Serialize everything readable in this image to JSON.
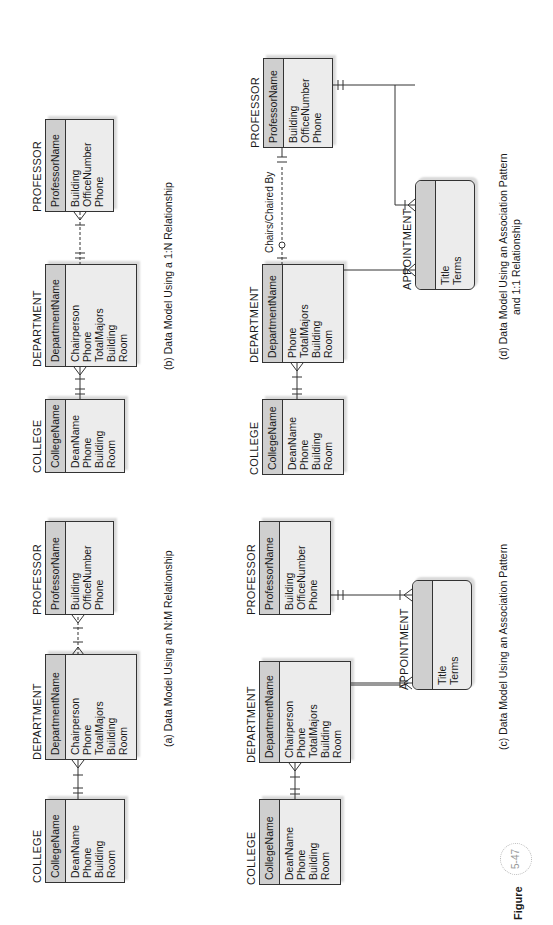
{
  "figure": {
    "label": "Figure",
    "number": "5-47"
  },
  "panels": {
    "a": {
      "caption": "(a) Data Model Using an N:M Relationship",
      "college": {
        "title": "COLLEGE",
        "key": "CollegeName",
        "attrs": [
          "DeanName",
          "Phone",
          "Building",
          "Room"
        ]
      },
      "department": {
        "title": "DEPARTMENT",
        "key": "DepartmentName",
        "attrs": [
          "Chairperson",
          "Phone",
          "TotalMajors",
          "Building",
          "Room"
        ]
      },
      "professor": {
        "title": "PROFESSOR",
        "key": "ProfessorName",
        "attrs": [
          "Building",
          "OfficeNumber",
          "Phone"
        ]
      }
    },
    "b": {
      "caption": "(b) Data Model Using a 1:N Relationship",
      "college": {
        "title": "COLLEGE",
        "key": "CollegeName",
        "attrs": [
          "DeanName",
          "Phone",
          "Building",
          "Room"
        ]
      },
      "department": {
        "title": "DEPARTMENT",
        "key": "DepartmentName",
        "attrs": [
          "Chairperson",
          "Phone",
          "TotalMajors",
          "Building",
          "Room"
        ]
      },
      "professor": {
        "title": "PROFESSOR",
        "key": "ProfessorName",
        "attrs": [
          "Building",
          "OfficeNumber",
          "Phone"
        ]
      }
    },
    "c": {
      "caption": "(c) Data Model Using an Association Pattern",
      "college": {
        "title": "COLLEGE",
        "key": "CollegeName",
        "attrs": [
          "DeanName",
          "Phone",
          "Building",
          "Room"
        ]
      },
      "department": {
        "title": "DEPARTMENT",
        "key": "DepartmentName",
        "attrs": [
          "Chairperson",
          "Phone",
          "TotalMajors",
          "Building",
          "Room"
        ]
      },
      "professor": {
        "title": "PROFESSOR",
        "key": "ProfessorName",
        "attrs": [
          "Building",
          "OfficeNumber",
          "Phone"
        ]
      },
      "appointment": {
        "title": "APPOINTMENT",
        "key": "",
        "attrs": [
          "Title",
          "Terms"
        ]
      }
    },
    "d": {
      "caption_line1": "(d) Data Model Using an Association Pattern",
      "caption_line2": "and 1:1 Relationship",
      "relationship_label": "Chairs/Chaired By",
      "college": {
        "title": "COLLEGE",
        "key": "CollegeName",
        "attrs": [
          "DeanName",
          "Phone",
          "Building",
          "Room"
        ]
      },
      "department": {
        "title": "DEPARTMENT",
        "key": "DepartmentName",
        "attrs": [
          "Phone",
          "TotalMajors",
          "Building",
          "Room"
        ]
      },
      "professor": {
        "title": "PROFESSOR",
        "key": "ProfessorName",
        "attrs": [
          "Building",
          "OfficeNumber",
          "Phone"
        ]
      },
      "appointment": {
        "title": "APPOINTMENT",
        "key": "",
        "attrs": [
          "Title",
          "Terms"
        ]
      }
    }
  }
}
